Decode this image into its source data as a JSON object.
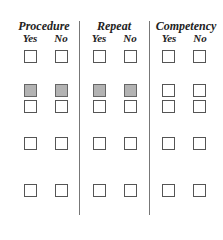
{
  "groups": [
    {
      "title": "Procedure",
      "yes": "Yes",
      "no": "No"
    },
    {
      "title": "Repeat",
      "yes": "Yes",
      "no": "No"
    },
    {
      "title": "Competency",
      "yes": "Yes",
      "no": "No"
    }
  ],
  "rows": [
    {
      "shaded": [
        false,
        false,
        false,
        false,
        false,
        false
      ]
    },
    {
      "shaded": [
        true,
        true,
        true,
        true,
        false,
        false
      ]
    },
    {
      "shaded": [
        false,
        false,
        false,
        false,
        false,
        false
      ]
    },
    {
      "shaded": [
        false,
        false,
        false,
        false,
        false,
        false
      ]
    },
    {
      "shaded": [
        false,
        false,
        false,
        false,
        false,
        false
      ]
    }
  ],
  "colors": {
    "shaded_fill": "#b3b3b3",
    "border": "#555555",
    "divider": "#777777"
  }
}
